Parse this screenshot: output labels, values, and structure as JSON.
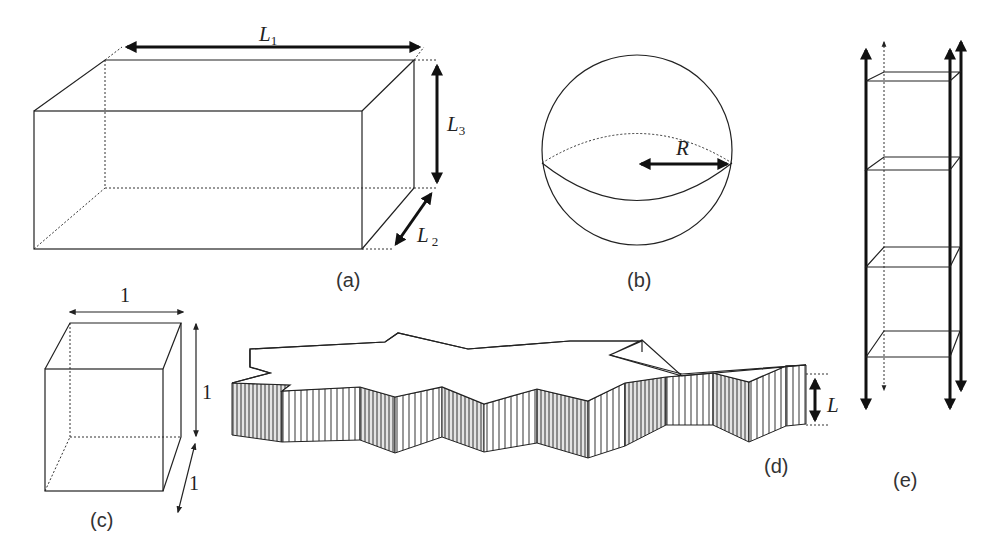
{
  "figure": {
    "panels": [
      {
        "id": "a",
        "caption": "(a)",
        "shape": "rectangular-box",
        "labels": {
          "length": "L",
          "length_sub": "1",
          "height": "L",
          "height_sub": "3",
          "depth": "L",
          "depth_sub": "2"
        }
      },
      {
        "id": "b",
        "caption": "(b)",
        "shape": "sphere",
        "labels": {
          "radius": "R"
        }
      },
      {
        "id": "c",
        "caption": "(c)",
        "shape": "unit-cube",
        "labels": {
          "width": "1",
          "height": "1",
          "depth": "1"
        }
      },
      {
        "id": "d",
        "caption": "(d)",
        "shape": "star-shaped-slab",
        "labels": {
          "thickness": "L"
        }
      },
      {
        "id": "e",
        "caption": "(e)",
        "shape": "infinite-column-of-slices",
        "labels": {}
      }
    ],
    "colors": {
      "line": "#222222",
      "background": "#ffffff",
      "wall_fill": "#e6e6e6"
    }
  }
}
